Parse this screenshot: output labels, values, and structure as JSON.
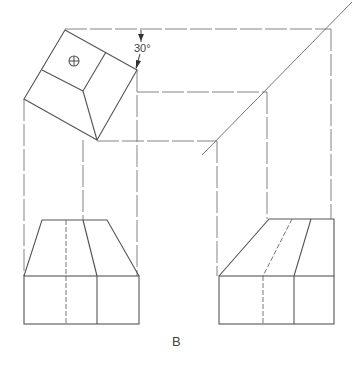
{
  "figure": {
    "angle_label": "30°",
    "caption": "B",
    "symbol": "circle-cross",
    "line_color": "#555555",
    "background": "#ffffff"
  }
}
